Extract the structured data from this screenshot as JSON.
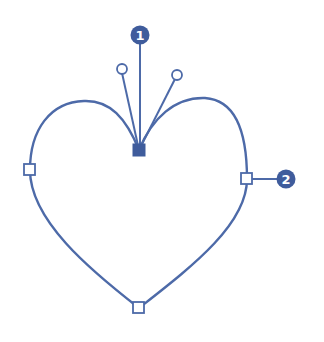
{
  "diagram": {
    "colors": {
      "stroke": "#4d6aa8",
      "badge_fill": "#3f5c9c",
      "badge_text": "#ffffff",
      "anchor_fill_open": "#ffffff",
      "anchor_fill_selected": "#3f5c9c",
      "background": "#ffffff"
    },
    "callouts": [
      {
        "label": "1",
        "target": "selected-corner-anchor"
      },
      {
        "label": "2",
        "target": "right-smooth-anchor"
      }
    ],
    "anchors": [
      {
        "id": "top-center",
        "type": "selected",
        "x": 139,
        "y": 150
      },
      {
        "id": "left",
        "type": "open",
        "x": 30,
        "y": 170
      },
      {
        "id": "right",
        "type": "open",
        "x": 247,
        "y": 179
      },
      {
        "id": "bottom",
        "type": "open",
        "x": 139,
        "y": 308
      }
    ],
    "handles": [
      {
        "id": "left-handle",
        "x": 122,
        "y": 69
      },
      {
        "id": "right-handle",
        "x": 177,
        "y": 75
      }
    ]
  }
}
